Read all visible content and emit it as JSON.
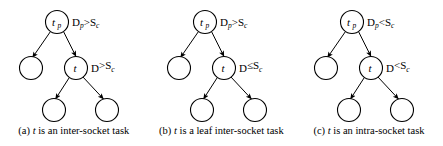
{
  "figure": {
    "background_color": "#ffffff",
    "stroke_color": "#000000",
    "panel_count": 3
  },
  "panels": [
    {
      "id": "a",
      "tag": "(a)",
      "root_node": {
        "name": "t",
        "subscript": "p"
      },
      "mid_node": {
        "name": "t",
        "subscript": ""
      },
      "root_condition": {
        "lhs": "D",
        "lhs_sub": "p",
        "op": ">",
        "rhs": "S",
        "rhs_sub": "c",
        "text": "Dp>Sc"
      },
      "mid_condition": {
        "lhs": "D",
        "lhs_sub": "",
        "op": ">",
        "rhs": "S",
        "rhs_sub": "c",
        "text": "D>Sc"
      },
      "caption_pre": "(a) ",
      "caption_italic": "t",
      "caption_post": " is an inter-socket task",
      "caption_full": "(a) t is an inter-socket task",
      "leaf_count": 3
    },
    {
      "id": "b",
      "tag": "(b)",
      "root_node": {
        "name": "t",
        "subscript": "p"
      },
      "mid_node": {
        "name": "t",
        "subscript": ""
      },
      "root_condition": {
        "lhs": "D",
        "lhs_sub": "p",
        "op": ">",
        "rhs": "S",
        "rhs_sub": "c",
        "text": "Dp>Sc"
      },
      "mid_condition": {
        "lhs": "D",
        "lhs_sub": "",
        "op": "≤",
        "rhs": "S",
        "rhs_sub": "c",
        "text": "D≤Sc"
      },
      "caption_pre": "(b) ",
      "caption_italic": "t",
      "caption_post": " is a leaf inter-socket task",
      "caption_full": "(b) t is a leaf inter-socket task",
      "leaf_count": 3
    },
    {
      "id": "c",
      "tag": "(c)",
      "root_node": {
        "name": "t",
        "subscript": "p"
      },
      "mid_node": {
        "name": "t",
        "subscript": ""
      },
      "root_condition": {
        "lhs": "D",
        "lhs_sub": "p",
        "op": "<",
        "rhs": "S",
        "rhs_sub": "c",
        "text": "Dp<Sc"
      },
      "mid_condition": {
        "lhs": "D",
        "lhs_sub": "",
        "op": "<",
        "rhs": "S",
        "rhs_sub": "c",
        "text": "D<Sc"
      },
      "caption_pre": "(c) ",
      "caption_italic": "t",
      "caption_post": " is an intra-socket task",
      "caption_full": "(c) t is an intra-socket task",
      "leaf_count": 3
    }
  ]
}
